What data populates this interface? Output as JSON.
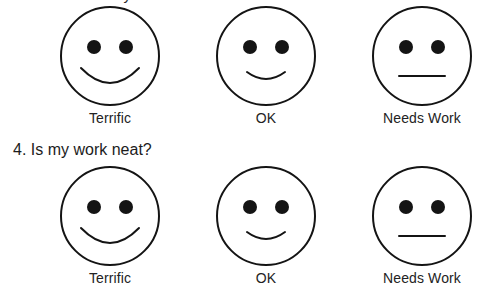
{
  "page": {
    "clipped_question_top": "3. Did I check my work?",
    "question": "4. Is my work neat?"
  },
  "faces": {
    "terrific_icon": "smiley-face-happy-icon",
    "ok_icon": "smiley-face-neutral-smile-icon",
    "needs_work_icon": "smiley-face-flat-mouth-icon"
  },
  "rows": [
    {
      "row_name": "rating-row-question-3",
      "options": [
        {
          "label": "Terrific",
          "face": "happy"
        },
        {
          "label": "OK",
          "face": "slight-smile"
        },
        {
          "label": "Needs Work",
          "face": "flat"
        }
      ]
    },
    {
      "row_name": "rating-row-question-4",
      "options": [
        {
          "label": "Terrific",
          "face": "happy"
        },
        {
          "label": "OK",
          "face": "slight-smile"
        },
        {
          "label": "Needs Work",
          "face": "flat"
        }
      ]
    }
  ],
  "style": {
    "ink": "#141414",
    "paper": "#ffffff",
    "stroke_width": 2
  }
}
